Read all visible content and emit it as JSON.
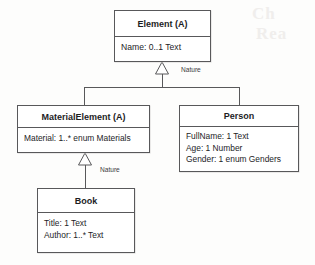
{
  "diagram": {
    "type": "uml-class-diagram",
    "background_color": "#fdfdfc",
    "line_color": "#58585a",
    "text_color": "#1d1d1f",
    "classes": [
      {
        "id": "element",
        "name": "Element (A)",
        "abstract": true,
        "attributes": [
          "Name: 0..1 Text"
        ]
      },
      {
        "id": "materialelement",
        "name": "MaterialElement (A)",
        "abstract": true,
        "attributes": [
          "Material: 1..* enum Materials"
        ]
      },
      {
        "id": "person",
        "name": "Person",
        "abstract": false,
        "attributes": [
          "FullName: 1 Text",
          "Age: 1 Number",
          "Gender: 1 enum Genders"
        ]
      },
      {
        "id": "book",
        "name": "Book",
        "abstract": false,
        "attributes": [
          "Title: 1 Text",
          "Author: 1..* Text"
        ]
      }
    ],
    "relationships": [
      {
        "kind": "generalization",
        "label": "Nature",
        "parent": "Element (A)",
        "children": [
          "MaterialElement (A)",
          "Person"
        ]
      },
      {
        "kind": "generalization",
        "label": "Nature",
        "parent": "MaterialElement (A)",
        "children": [
          "Book"
        ]
      }
    ],
    "bleed_through": {
      "line1": "Ch",
      "line2": "Rea"
    }
  }
}
